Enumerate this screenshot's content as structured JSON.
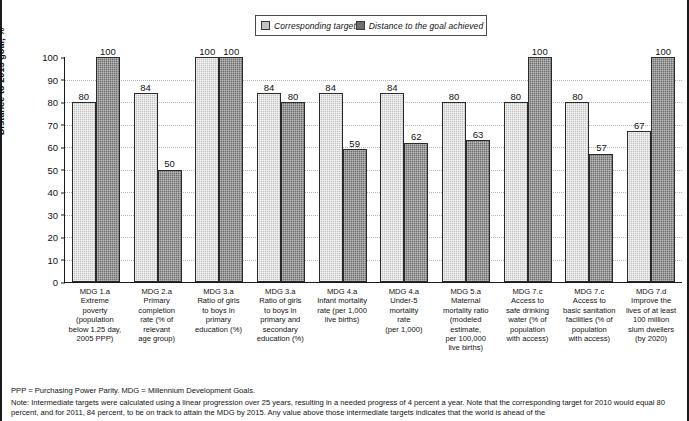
{
  "legend": {
    "entries": [
      {
        "label": "Corresponding target",
        "color": "#c3c3c3",
        "icon": "legend-swatch-light"
      },
      {
        "label": "Distance to the goal achieved",
        "color": "#6e6e6e",
        "icon": "legend-swatch-dark"
      }
    ]
  },
  "axis": {
    "y_title": "Distance to 2015 goal, %",
    "y_ticks": [
      "100",
      "90",
      "80",
      "70",
      "60",
      "50",
      "40",
      "30",
      "20",
      "10",
      "0"
    ],
    "y_min": 0,
    "y_max": 100
  },
  "footnotes": {
    "abbreviations": "PPP = Purchasing Power Parity. MDG = Millennium Development Goals.",
    "note": "Note: Intermediate targets were calculated using a linear progression over 25 years, resulting in a needed progress of 4 percent a year. Note that the corresponding target for 2010 would equal 80 percent, and for 2011, 84 percent, to be on track to attain the MDG by 2015. Any value above those intermediate targets indicates that the world is ahead of the"
  },
  "chart_data": {
    "type": "bar",
    "title": "",
    "xlabel": "",
    "ylabel": "Distance to 2015 goal, %",
    "ylim": [
      0,
      100
    ],
    "grid": true,
    "legend_position": "top-center",
    "categories": [
      "MDG 1.a Extreme poverty (population below 1.25 day, 2005 PPP)",
      "MDG 2.a Primary completion rate (% of relevant age group)",
      "MDG 3.a Ratio of girls to boys in primary education (%)",
      "MDG 3.a Ratio of girls to boys in primary and secondary education (%)",
      "MDG 4.a Infant mortality rate (per 1,000 live births)",
      "MDG 4.a Under-5 mortality rate (per 1,000)",
      "MDG 5.a Maternal mortality ratio (modeled estimate, per 100,000 live births)",
      "MDG 7.c Access to safe drinking water (% of population with access)",
      "MDG 7.c Access to basic sanitation facilities (% of population with access)",
      "MDG 7.d Improve the lives of at least 100 million slum dwellers (by 2020)"
    ],
    "category_lines": [
      [
        "MDG 1.a",
        "Extreme",
        "poverty",
        "(population",
        "below 1.25 day,",
        "2005 PPP)"
      ],
      [
        "MDG 2.a",
        "Primary",
        "completion",
        "rate (% of",
        "relevant",
        "age group)"
      ],
      [
        "MDG 3.a",
        "Ratio of girls",
        "to boys in",
        "primary",
        "education (%)"
      ],
      [
        "MDG 3.a",
        "Ratio of girls",
        "to boys in",
        "primary and",
        "secondary",
        "education (%)"
      ],
      [
        "MDG 4.a",
        "Infant mortality",
        "rate (per 1,000",
        "live births)"
      ],
      [
        "MDG 4.a",
        "Under-5",
        "mortality",
        "rate",
        "(per 1,000)"
      ],
      [
        "MDG 5.a",
        "Maternal",
        "mortality ratio",
        "(modeled",
        "estimate,",
        "per 100,000",
        "live births)"
      ],
      [
        "MDG 7.c",
        "Access to",
        "safe drinking",
        "water (% of",
        "population",
        "with access)"
      ],
      [
        "MDG 7.c",
        "Access to",
        "basic sanitation",
        "facilities (% of",
        "population",
        "with access)"
      ],
      [
        "MDG 7.d",
        "Improve the",
        "lives of at least",
        "100 million",
        "slum dwellers",
        "(by 2020)"
      ]
    ],
    "series": [
      {
        "name": "Corresponding target",
        "color": "#c3c3c3",
        "values": [
          80,
          84,
          100,
          84,
          84,
          84,
          80,
          80,
          80,
          67
        ]
      },
      {
        "name": "Distance to the goal achieved",
        "color": "#6e6e6e",
        "values": [
          100,
          50,
          100,
          80,
          59,
          62,
          63,
          100,
          57,
          100
        ]
      }
    ]
  }
}
